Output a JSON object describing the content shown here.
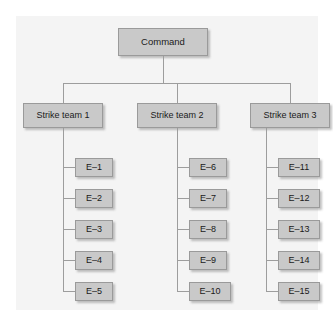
{
  "diagram": {
    "type": "organizational-hierarchy",
    "background_color": "#f4f4f4",
    "node_fill_color": "#c9c9c9",
    "node_border_color": "#9a9a9a",
    "connector_color": "#9d9d9d",
    "root": {
      "label": "Command"
    },
    "branches": [
      {
        "label": "Strike team 1",
        "children": [
          {
            "label": "E–1"
          },
          {
            "label": "E–2"
          },
          {
            "label": "E–3"
          },
          {
            "label": "E–4"
          },
          {
            "label": "E–5"
          }
        ]
      },
      {
        "label": "Strike team 2",
        "children": [
          {
            "label": "E–6"
          },
          {
            "label": "E–7"
          },
          {
            "label": "E–8"
          },
          {
            "label": "E–9"
          },
          {
            "label": "E–10"
          }
        ]
      },
      {
        "label": "Strike team 3",
        "children": [
          {
            "label": "E–11"
          },
          {
            "label": "E–12"
          },
          {
            "label": "E–13"
          },
          {
            "label": "E–14"
          },
          {
            "label": "E–15"
          }
        ]
      }
    ]
  }
}
